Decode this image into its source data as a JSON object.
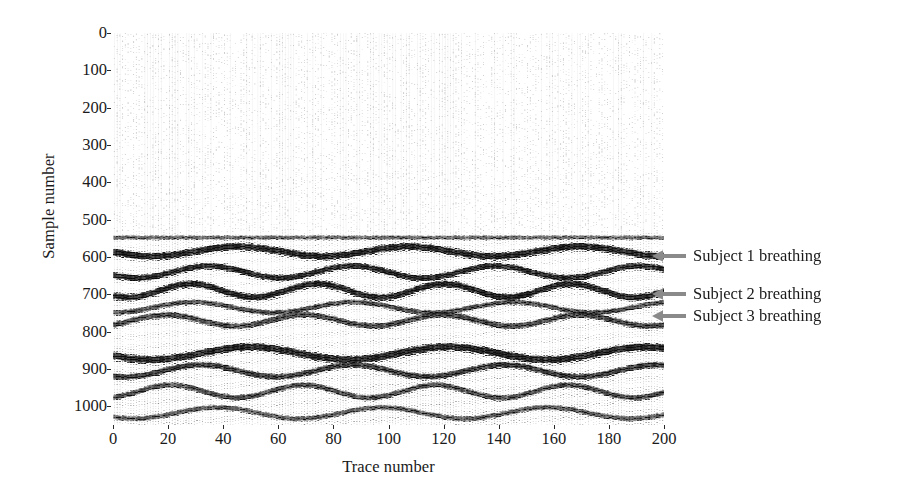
{
  "figure": {
    "type": "radargram-wiggle-trace",
    "background_color": "#ffffff",
    "trace_color": "#111111",
    "arrow_color": "#8a8a8a"
  },
  "chart_data": {
    "type": "heatmap",
    "title": "",
    "subtitle": "",
    "xlabel": "Trace number",
    "ylabel": "Sample number",
    "xlim": [
      0,
      200
    ],
    "ylim": [
      0,
      1050
    ],
    "y_axis_inverted": true,
    "grid": false,
    "legend_position": "right-annotations",
    "x_ticks": [
      0,
      20,
      40,
      60,
      80,
      100,
      120,
      140,
      160,
      180,
      200
    ],
    "x_tick_labels": [
      "0",
      "20",
      "40",
      "60",
      "80",
      "100",
      "120",
      "140",
      "160",
      "180",
      "200"
    ],
    "y_ticks": [
      0,
      100,
      200,
      300,
      400,
      500,
      600,
      700,
      800,
      900,
      1000
    ],
    "y_tick_labels": [
      "0",
      "100",
      "200",
      "300",
      "400",
      "500",
      "600",
      "700",
      "800",
      "900",
      "1000"
    ],
    "quiet_zone": {
      "sample_start": 0,
      "sample_end": 535,
      "description": "low-amplitude noise, faint vertical traces"
    },
    "reflection_bands": [
      {
        "name": "direct-wave",
        "center_sample": 548,
        "thickness": 9,
        "amplitude": 0,
        "period": 1,
        "phase": 0,
        "darkness": 0.55,
        "wiggle": 0.35
      },
      {
        "name": "subject-1-breathing",
        "center_sample": 585,
        "thickness": 15,
        "amplitude": 13,
        "period": 62,
        "phase": 0.15,
        "darkness": 1.0,
        "wiggle": 1.0
      },
      {
        "name": "subject-1-secondary",
        "center_sample": 640,
        "thickness": 13,
        "amplitude": 16,
        "period": 52,
        "phase": 0.55,
        "darkness": 0.95,
        "wiggle": 0.95
      },
      {
        "name": "subject-2-breathing",
        "center_sample": 690,
        "thickness": 14,
        "amplitude": 18,
        "period": 46,
        "phase": 0.9,
        "darkness": 1.0,
        "wiggle": 1.0
      },
      {
        "name": "subject-2-secondary",
        "center_sample": 735,
        "thickness": 11,
        "amplitude": 14,
        "period": 58,
        "phase": 1.6,
        "darkness": 0.7,
        "wiggle": 0.8
      },
      {
        "name": "subject-3-breathing",
        "center_sample": 770,
        "thickness": 13,
        "amplitude": 15,
        "period": 50,
        "phase": 2.3,
        "darkness": 0.72,
        "wiggle": 0.85
      },
      {
        "name": "strong-floor-reflection",
        "center_sample": 858,
        "thickness": 16,
        "amplitude": 17,
        "period": 72,
        "phase": 0.4,
        "darkness": 1.0,
        "wiggle": 1.0
      },
      {
        "name": "multiple-1",
        "center_sample": 905,
        "thickness": 13,
        "amplitude": 16,
        "period": 55,
        "phase": 1.1,
        "darkness": 0.8,
        "wiggle": 0.9
      },
      {
        "name": "multiple-2",
        "center_sample": 960,
        "thickness": 12,
        "amplitude": 17,
        "period": 48,
        "phase": 2.0,
        "darkness": 0.7,
        "wiggle": 0.85
      },
      {
        "name": "multiple-3",
        "center_sample": 1018,
        "thickness": 11,
        "amplitude": 15,
        "period": 60,
        "phase": 0.8,
        "darkness": 0.62,
        "wiggle": 0.8
      }
    ],
    "annotations": [
      {
        "label": "Subject 1 breathing",
        "target_sample": 598,
        "target_trace": 200,
        "arrow": "arrow-left"
      },
      {
        "label": "Subject 2 breathing",
        "target_sample": 700,
        "target_trace": 200,
        "arrow": "arrow-left"
      },
      {
        "label": "Subject 3 breathing",
        "target_sample": 758,
        "target_trace": 200,
        "arrow": "arrow-left"
      }
    ]
  }
}
